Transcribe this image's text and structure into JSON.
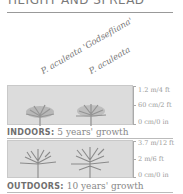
{
  "header": {
    "title": "HEIGHT AND SPREAD"
  },
  "plants": [
    {
      "label": "P. aculeata 'Godsefliana'"
    },
    {
      "label": "P. aculeata"
    }
  ],
  "indoors": {
    "caption_bold": "INDOORS:",
    "caption_text": " 5 years' growth",
    "scale": [
      "1.2 m/4 ft",
      "60 cm/2 ft",
      "0 cm/0 in"
    ]
  },
  "outdoors": {
    "caption_bold": "OUTDOORS:",
    "caption_text": " 10 years' growth",
    "scale": [
      "3.7 m/12 ft",
      "2 m/6 ft",
      "0 cm/0 in"
    ]
  },
  "colors": {
    "panel": "#dcdcdc",
    "tree": "#8f8f8f",
    "text": "#8a8a8a"
  }
}
